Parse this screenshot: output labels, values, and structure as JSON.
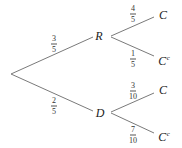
{
  "diagram": {
    "type": "probability-tree",
    "colors": {
      "edge": "#7a7a7a",
      "text": "#222222"
    },
    "root": {
      "x": 11,
      "y": 74
    },
    "level1": [
      {
        "label": "R",
        "x": 99,
        "y": 36,
        "edge_end": {
          "x": 93,
          "y": 37
        },
        "branch_start": {
          "x": 111,
          "y": 36
        },
        "prob": {
          "num": "3",
          "den": "5",
          "x": 54,
          "y": 44
        },
        "children": [
          {
            "label": "C",
            "sup": "",
            "x": 163,
            "y": 15,
            "edge_end": {
              "x": 154,
              "y": 17
            },
            "prob": {
              "num": "4",
              "den": "5",
              "x": 133,
              "y": 14
            }
          },
          {
            "label": "C",
            "sup": "c",
            "x": 163,
            "y": 59,
            "edge_end": {
              "x": 154,
              "y": 56
            },
            "prob": {
              "num": "1",
              "den": "5",
              "x": 133,
              "y": 59
            }
          }
        ]
      },
      {
        "label": "D",
        "x": 100,
        "y": 113,
        "edge_end": {
          "x": 93,
          "y": 111
        },
        "branch_start": {
          "x": 111,
          "y": 113
        },
        "prob": {
          "num": "2",
          "den": "5",
          "x": 54,
          "y": 106
        },
        "children": [
          {
            "label": "C",
            "sup": "",
            "x": 163,
            "y": 90,
            "edge_end": {
              "x": 154,
              "y": 93
            },
            "prob": {
              "num": "3",
              "den": "10",
              "x": 133,
              "y": 91
            }
          },
          {
            "label": "C",
            "sup": "c",
            "x": 163,
            "y": 135,
            "edge_end": {
              "x": 154,
              "y": 133
            },
            "prob": {
              "num": "7",
              "den": "10",
              "x": 133,
              "y": 135
            }
          }
        ]
      }
    ]
  }
}
